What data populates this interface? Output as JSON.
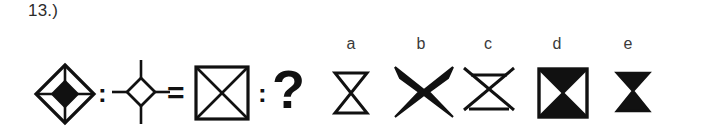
{
  "item": {
    "number_label": "13.)",
    "type": "figural-analogy",
    "relation_operator": "=",
    "ratio_operator": ":",
    "unknown_marker": "?"
  },
  "stem": {
    "term_a": {
      "name": "diamond-with-cross-and-filled-center",
      "description": "Large outlined diamond (rotated square) with horizontal and vertical internal lines, solid black small diamond at center",
      "fill": "#111111",
      "stroke": "#111111"
    },
    "term_b": {
      "name": "small-diamond-with-radiating-cross",
      "description": "Small outlined diamond with four line segments radiating up, down, left and right",
      "fill": "#ffffff",
      "stroke": "#111111"
    },
    "term_c": {
      "name": "square-with-diagonals",
      "description": "Outlined square with both diagonals drawn forming an X",
      "fill": "#ffffff",
      "stroke": "#111111"
    },
    "term_d": {
      "name": "unknown-term",
      "description": "Unknown fourth term shown as a question mark"
    }
  },
  "options": [
    {
      "letter": "a",
      "name": "outline-hourglass",
      "description": "Unfilled hourglass: two triangles meeting at a point with flat top and bottom edges",
      "fill": "#ffffff",
      "stroke": "#111111"
    },
    {
      "letter": "b",
      "name": "filled-hourglass-flared",
      "description": "Solid black hourglass with flared concave top and bottom edges",
      "fill": "#111111",
      "stroke": "#111111"
    },
    {
      "letter": "c",
      "name": "outline-hourglass-extended-x",
      "description": "Unfilled hourglass whose diagonal strokes extend past the top corners forming an X",
      "fill": "#ffffff",
      "stroke": "#111111"
    },
    {
      "letter": "d",
      "name": "square-with-filled-hourglass",
      "description": "Outlined square with both diagonals; the top and bottom triangles are filled solid black",
      "fill": "#111111",
      "stroke": "#111111"
    },
    {
      "letter": "e",
      "name": "small-filled-hourglass",
      "description": "Small solid black hourglass with flat top and bottom edges",
      "fill": "#111111",
      "stroke": "#111111"
    }
  ],
  "colors": {
    "background": "#ffffff",
    "ink": "#111111",
    "text": "#2b2b2b"
  }
}
